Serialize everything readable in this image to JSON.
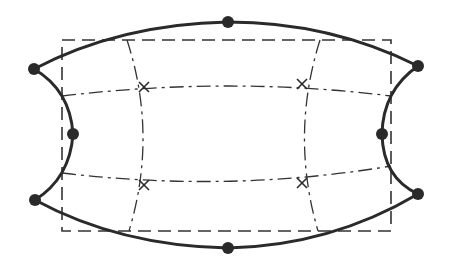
{
  "diagram": {
    "title": "",
    "colors": {
      "background": "#ffffff",
      "stroke": "#2a2a2a",
      "node": "#2a2a2a"
    },
    "reference_rectangle": {
      "x": 62,
      "y": 40,
      "width": 329,
      "height": 191,
      "style": "dashed"
    },
    "boundary_nodes": [
      {
        "id": "top-left",
        "x": 34,
        "y": 69
      },
      {
        "id": "top-middle",
        "x": 228,
        "y": 22
      },
      {
        "id": "top-right",
        "x": 418,
        "y": 66
      },
      {
        "id": "left-middle",
        "x": 73,
        "y": 134
      },
      {
        "id": "right-middle",
        "x": 382,
        "y": 134
      },
      {
        "id": "bottom-left",
        "x": 35,
        "y": 200
      },
      {
        "id": "bottom-middle",
        "x": 228,
        "y": 248
      },
      {
        "id": "bottom-right",
        "x": 418,
        "y": 194
      }
    ],
    "interior_points": [
      {
        "id": "upper-left-cross",
        "x": 144,
        "y": 87
      },
      {
        "id": "upper-right-cross",
        "x": 302,
        "y": 84
      },
      {
        "id": "lower-left-cross",
        "x": 144,
        "y": 185
      },
      {
        "id": "lower-right-cross",
        "x": 302,
        "y": 183
      }
    ],
    "labels": []
  }
}
